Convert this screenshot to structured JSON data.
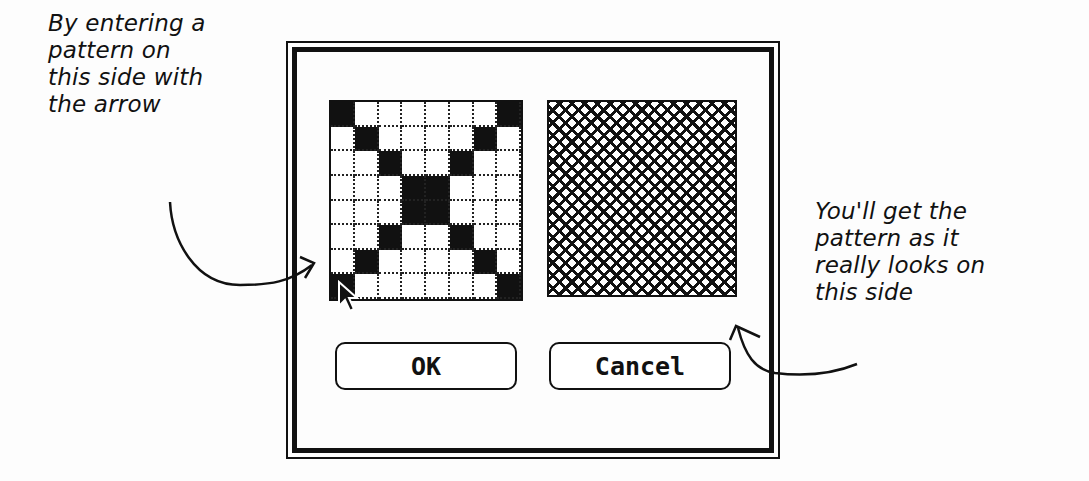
{
  "annotations": {
    "left": [
      "By entering a",
      "pattern on",
      "this side with",
      "the arrow"
    ],
    "right": [
      "You'll get the",
      "pattern as it",
      "really looks on",
      "this side"
    ]
  },
  "dialog": {
    "pattern_editor": {
      "grid_size": 8,
      "filled_cells": [
        [
          0,
          0
        ],
        [
          0,
          7
        ],
        [
          1,
          1
        ],
        [
          1,
          6
        ],
        [
          2,
          2
        ],
        [
          2,
          5
        ],
        [
          3,
          3
        ],
        [
          3,
          4
        ],
        [
          4,
          3
        ],
        [
          4,
          4
        ],
        [
          5,
          2
        ],
        [
          5,
          5
        ],
        [
          6,
          1
        ],
        [
          6,
          6
        ],
        [
          7,
          0
        ],
        [
          7,
          7
        ]
      ]
    },
    "preview": {
      "pattern": "diagonal-crosshatch"
    },
    "buttons": {
      "ok": "OK",
      "cancel": "Cancel"
    }
  },
  "colors": {
    "ink": "#111111",
    "background": "#fdfdfd"
  }
}
